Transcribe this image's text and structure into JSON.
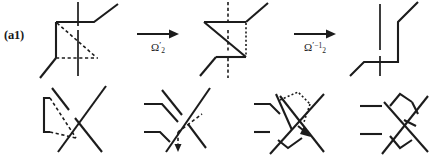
{
  "figure": {
    "kind": "knot-diagram-move-sequence",
    "background_color": "#ffffff",
    "ink_color": "#1c1c1c",
    "width": 433,
    "height": 161
  },
  "rows": [
    {
      "id": "a1",
      "label": "(a1)",
      "panel_count": 3,
      "arrows": [
        {
          "id": "a1-arrow-1",
          "glyph": "→",
          "label_base": "Ω",
          "label_subscript": "2",
          "label_prime": "′",
          "label_superscript": "",
          "label_plain": "Ω′₂"
        },
        {
          "id": "a1-arrow-2",
          "glyph": "→",
          "label_base": "Ω",
          "label_subscript": "2",
          "label_prime": "′",
          "label_superscript": "−1",
          "label_plain": "Ω′₂⁻¹"
        }
      ]
    },
    {
      "id": "c1",
      "label": "(c1)",
      "panel_count": 4,
      "arrows": [
        {
          "id": "c1-arrow-1",
          "glyph": "→",
          "label_base": "Ω",
          "label_subscript": "2",
          "label_prime": "",
          "label_superscript": "",
          "label_plain": "Ω₂"
        },
        {
          "id": "c1-arrow-2",
          "glyph": "→",
          "label_base": "Ω",
          "label_subscript": "2",
          "label_prime": "",
          "label_superscript": "",
          "label_plain": "Ω₂"
        },
        {
          "id": "c1-arrow-3",
          "glyph": "→",
          "label_base": "Ω",
          "label_subscript": "3",
          "label_prime": "",
          "label_superscript": "",
          "label_plain": "Ω₃"
        }
      ]
    }
  ]
}
